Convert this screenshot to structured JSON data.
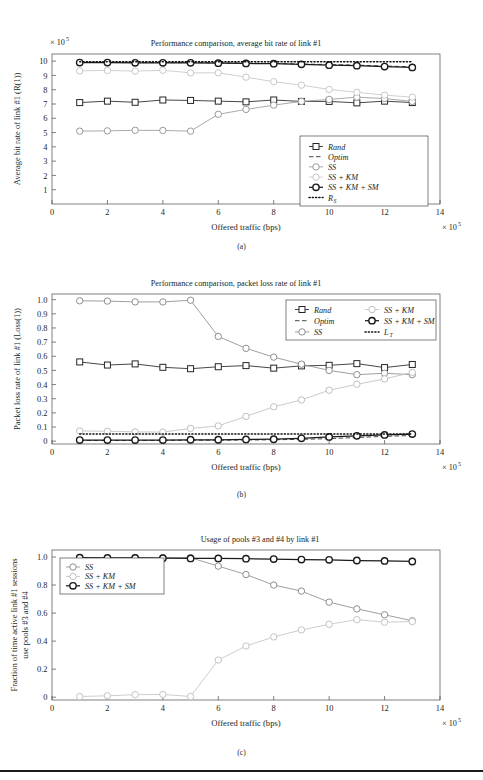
{
  "figure": {
    "panels": [
      "a",
      "b",
      "c"
    ],
    "shared_xlabel": "Offered traffic (bps)",
    "shared_x_multiplier": "× 10",
    "shared_x_exponent": "5"
  },
  "panel_a": {
    "caption": "(a)",
    "y_multiplier": "× 10",
    "y_exponent": "5"
  },
  "panel_b": {
    "caption": "(b)"
  },
  "panel_c": {
    "caption": "(c)"
  },
  "chart_data": [
    {
      "type": "line",
      "panel": "a",
      "title": "Performance comparison, average bit rate of link #1",
      "xlabel": "Offered traffic (bps)",
      "ylabel": "Average bit rate of link #1 (R(1))",
      "x": [
        1,
        2,
        3,
        4,
        5,
        6,
        7,
        8,
        9,
        10,
        11,
        12,
        13
      ],
      "xlim": [
        0,
        14
      ],
      "xticks": [
        0,
        2,
        4,
        6,
        8,
        10,
        12,
        14
      ],
      "ylim": [
        0,
        10.5
      ],
      "yticks": [
        1,
        2,
        3,
        4,
        5,
        6,
        7,
        8,
        9,
        10
      ],
      "x_scale_note": "× 10^5",
      "y_scale_note": "× 10^5",
      "grid": false,
      "legend_position": "lower-right",
      "series": [
        {
          "name": "Rand",
          "marker": "square",
          "color": "#262626",
          "style": "solid",
          "values": [
            7.1,
            7.2,
            7.12,
            7.28,
            7.25,
            7.2,
            7.15,
            7.28,
            7.18,
            7.18,
            7.08,
            7.2,
            7.1
          ]
        },
        {
          "name": "Optim",
          "marker": "none",
          "color": "#262626",
          "style": "dashed",
          "values": [
            9.92,
            9.92,
            9.9,
            9.9,
            9.9,
            9.88,
            9.86,
            9.84,
            9.8,
            9.76,
            9.72,
            9.66,
            9.6
          ]
        },
        {
          "name": "SS",
          "marker": "circle",
          "color": "#9a9a9a",
          "style": "solid",
          "values": [
            5.1,
            5.12,
            5.16,
            5.15,
            5.1,
            6.28,
            6.62,
            6.92,
            7.18,
            7.32,
            7.48,
            7.38,
            7.18
          ]
        },
        {
          "name": "SS + KM",
          "marker": "circle",
          "color": "#c8c8c8",
          "style": "solid",
          "values": [
            9.32,
            9.35,
            9.3,
            9.36,
            9.18,
            9.18,
            8.88,
            8.56,
            8.32,
            8.02,
            7.82,
            7.62,
            7.48
          ]
        },
        {
          "name": "SS + KM + SM",
          "marker": "circle",
          "color": "#1a1a1a",
          "style": "solid",
          "values": [
            9.9,
            9.9,
            9.88,
            9.88,
            9.88,
            9.86,
            9.84,
            9.82,
            9.78,
            9.72,
            9.68,
            9.62,
            9.56
          ]
        },
        {
          "name": "R_S",
          "marker": "none",
          "color": "#111111",
          "style": "dotted",
          "values": [
            9.95,
            9.95,
            9.95,
            9.95,
            9.95,
            9.95,
            9.95,
            9.95,
            9.95,
            9.95,
            9.95,
            9.95,
            9.95
          ]
        }
      ],
      "legend": [
        {
          "label": "Rand",
          "marker": "square",
          "color": "#262626",
          "style": "solid"
        },
        {
          "label": "Optim",
          "marker": "none",
          "color": "#262626",
          "style": "dashed"
        },
        {
          "label": "SS",
          "marker": "circle",
          "color": "#9a9a9a",
          "style": "solid"
        },
        {
          "label": "SS + KM",
          "marker": "circle",
          "color": "#c8c8c8",
          "style": "solid"
        },
        {
          "label": "SS + KM + SM",
          "marker": "circle",
          "color": "#1a1a1a",
          "style": "solid"
        },
        {
          "label": "R_S",
          "marker": "none",
          "color": "#111111",
          "style": "dotted"
        }
      ]
    },
    {
      "type": "line",
      "panel": "b",
      "title": "Performance comparison, packet loss rate of link #1",
      "xlabel": "Offered traffic (bps)",
      "ylabel": "Packet loss rate of link #1 (Loss(1))",
      "x": [
        1,
        2,
        3,
        4,
        5,
        6,
        7,
        8,
        9,
        10,
        11,
        12,
        13
      ],
      "xlim": [
        0,
        14
      ],
      "xticks": [
        0,
        2,
        4,
        6,
        8,
        10,
        12,
        14
      ],
      "ylim": [
        -0.02,
        1.04
      ],
      "yticks": [
        0,
        0.1,
        0.2,
        0.3,
        0.4,
        0.5,
        0.6,
        0.7,
        0.8,
        0.9,
        1.0
      ],
      "x_scale_note": "× 10^5",
      "grid": false,
      "legend_position": "upper-right",
      "series": [
        {
          "name": "Rand",
          "marker": "square",
          "color": "#262626",
          "style": "solid",
          "values": [
            0.56,
            0.538,
            0.546,
            0.522,
            0.512,
            0.526,
            0.534,
            0.516,
            0.532,
            0.536,
            0.548,
            0.52,
            0.542
          ]
        },
        {
          "name": "Optim",
          "marker": "none",
          "color": "#262626",
          "style": "dashed",
          "values": [
            0.005,
            0.005,
            0.005,
            0.006,
            0.007,
            0.007,
            0.008,
            0.01,
            0.013,
            0.018,
            0.026,
            0.034,
            0.04
          ]
        },
        {
          "name": "SS",
          "marker": "circle",
          "color": "#8e8e8e",
          "style": "solid",
          "values": [
            0.992,
            0.99,
            0.984,
            0.984,
            0.996,
            0.74,
            0.656,
            0.594,
            0.544,
            0.5,
            0.47,
            0.48,
            0.47
          ]
        },
        {
          "name": "SS + KM",
          "marker": "circle",
          "color": "#c0c0c0",
          "style": "solid",
          "values": [
            0.072,
            0.07,
            0.066,
            0.064,
            0.09,
            0.108,
            0.175,
            0.243,
            0.291,
            0.36,
            0.402,
            0.44,
            0.486
          ]
        },
        {
          "name": "SS + KM + SM",
          "marker": "circle",
          "color": "#1a1a1a",
          "style": "solid",
          "values": [
            0.008,
            0.008,
            0.008,
            0.008,
            0.01,
            0.01,
            0.012,
            0.014,
            0.02,
            0.03,
            0.038,
            0.044,
            0.05
          ]
        },
        {
          "name": "L_T",
          "marker": "none",
          "color": "#111111",
          "style": "dotted",
          "values": [
            0.05,
            0.05,
            0.05,
            0.05,
            0.05,
            0.05,
            0.05,
            0.05,
            0.05,
            0.05,
            0.05,
            0.05,
            0.05
          ]
        }
      ],
      "legend_columns": 2,
      "legend": [
        {
          "label": "Rand",
          "marker": "square",
          "color": "#262626",
          "style": "solid"
        },
        {
          "label": "SS + KM",
          "marker": "circle",
          "color": "#c0c0c0",
          "style": "solid"
        },
        {
          "label": "Optim",
          "marker": "none",
          "color": "#262626",
          "style": "dashed"
        },
        {
          "label": "SS + KM + SM",
          "marker": "circle",
          "color": "#1a1a1a",
          "style": "solid"
        },
        {
          "label": "SS",
          "marker": "circle",
          "color": "#8e8e8e",
          "style": "solid"
        },
        {
          "label": "L_T",
          "marker": "none",
          "color": "#111111",
          "style": "dotted"
        }
      ]
    },
    {
      "type": "line",
      "panel": "c",
      "title": "Usage of pools #3 and #4 by link #1",
      "xlabel": "Offered traffic (bps)",
      "ylabel": "Fraction of time active link #1 sessions use pools #3 and #4",
      "ylabel_line1": "Fraction of time active link #1 sessions",
      "ylabel_line2": "use pools #3 and #4",
      "x": [
        1,
        2,
        3,
        4,
        5,
        6,
        7,
        8,
        9,
        10,
        11,
        12,
        13
      ],
      "xlim": [
        0,
        14
      ],
      "xticks": [
        0,
        2,
        4,
        6,
        8,
        10,
        12,
        14
      ],
      "ylim": [
        -0.02,
        1.05
      ],
      "yticks": [
        0,
        0.2,
        0.4,
        0.6,
        0.8,
        1.0
      ],
      "x_scale_note": "× 10^5",
      "grid": false,
      "legend_position": "upper-left",
      "series": [
        {
          "name": "SS",
          "marker": "circle",
          "color": "#8e8e8e",
          "style": "solid",
          "values": [
            0.995,
            0.992,
            0.995,
            0.995,
            0.995,
            0.935,
            0.875,
            0.8,
            0.757,
            0.678,
            0.63,
            0.588,
            0.545
          ]
        },
        {
          "name": "SS + KM",
          "marker": "circle",
          "color": "#c4c4c4",
          "style": "solid",
          "values": [
            0.005,
            0.01,
            0.018,
            0.02,
            0.005,
            0.265,
            0.365,
            0.43,
            0.48,
            0.52,
            0.553,
            0.535,
            0.54
          ]
        },
        {
          "name": "SS + KM + SM",
          "marker": "circle",
          "color": "#1a1a1a",
          "style": "solid",
          "values": [
            0.995,
            0.993,
            0.993,
            0.992,
            0.99,
            0.99,
            0.988,
            0.985,
            0.982,
            0.98,
            0.975,
            0.972,
            0.968
          ]
        }
      ],
      "legend": [
        {
          "label": "SS",
          "marker": "circle",
          "color": "#8e8e8e",
          "style": "solid"
        },
        {
          "label": "SS + KM",
          "marker": "circle",
          "color": "#c4c4c4",
          "style": "solid"
        },
        {
          "label": "SS + KM + SM",
          "marker": "circle",
          "color": "#1a1a1a",
          "style": "solid"
        }
      ]
    }
  ]
}
